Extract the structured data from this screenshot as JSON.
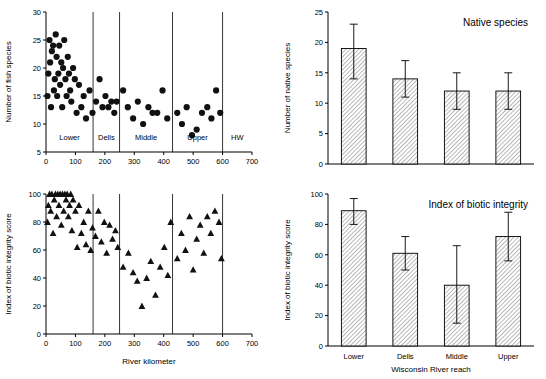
{
  "chart_data": [
    {
      "id": "scatter-species",
      "type": "scatter",
      "title": "",
      "xlabel": "",
      "ylabel": "Number of fish species",
      "xlim": [
        0,
        700
      ],
      "xticks": [
        0,
        100,
        200,
        300,
        400,
        500,
        600,
        700
      ],
      "ylim": [
        5,
        30
      ],
      "yticks": [
        5,
        10,
        15,
        20,
        25,
        30
      ],
      "grid": false,
      "reach_dividers": [
        160,
        250,
        430,
        600
      ],
      "reach_labels": [
        {
          "label": "Lower",
          "x": 80
        },
        {
          "label": "Dells",
          "x": 205
        },
        {
          "label": "Middle",
          "x": 340
        },
        {
          "label": "Upper",
          "x": 515
        },
        {
          "label": "HW",
          "x": 650
        }
      ],
      "marker": "circle",
      "points": [
        [
          5,
          15
        ],
        [
          8,
          19
        ],
        [
          12,
          25
        ],
        [
          14,
          21
        ],
        [
          17,
          13
        ],
        [
          20,
          23
        ],
        [
          24,
          24
        ],
        [
          27,
          16
        ],
        [
          30,
          18
        ],
        [
          33,
          26
        ],
        [
          36,
          22
        ],
        [
          38,
          15
        ],
        [
          42,
          19
        ],
        [
          45,
          24
        ],
        [
          48,
          17
        ],
        [
          52,
          21
        ],
        [
          55,
          13
        ],
        [
          58,
          20
        ],
        [
          62,
          25
        ],
        [
          66,
          18
        ],
        [
          70,
          15
        ],
        [
          74,
          22
        ],
        [
          78,
          19
        ],
        [
          82,
          16
        ],
        [
          86,
          14
        ],
        [
          92,
          20
        ],
        [
          98,
          18
        ],
        [
          104,
          12
        ],
        [
          112,
          17
        ],
        [
          120,
          13
        ],
        [
          128,
          15
        ],
        [
          136,
          11
        ],
        [
          148,
          16
        ],
        [
          158,
          12
        ],
        [
          170,
          14
        ],
        [
          182,
          18
        ],
        [
          192,
          13
        ],
        [
          202,
          15
        ],
        [
          212,
          13
        ],
        [
          222,
          14
        ],
        [
          232,
          12
        ],
        [
          240,
          14
        ],
        [
          262,
          16
        ],
        [
          278,
          13
        ],
        [
          296,
          11
        ],
        [
          312,
          14
        ],
        [
          330,
          10
        ],
        [
          348,
          13
        ],
        [
          362,
          12
        ],
        [
          378,
          12
        ],
        [
          396,
          16
        ],
        [
          412,
          11
        ],
        [
          446,
          12
        ],
        [
          462,
          10
        ],
        [
          478,
          13
        ],
        [
          496,
          8
        ],
        [
          512,
          9
        ],
        [
          530,
          12
        ],
        [
          548,
          13
        ],
        [
          562,
          11
        ],
        [
          578,
          16
        ],
        [
          592,
          12
        ]
      ]
    },
    {
      "id": "bar-native-species",
      "type": "bar",
      "title": "Native species",
      "xlabel": "",
      "ylabel": "Number of native species",
      "categories": [
        "Lower",
        "Dells",
        "Middle",
        "Upper"
      ],
      "values": [
        19,
        14,
        12,
        12
      ],
      "errors_upper": [
        23,
        17,
        15,
        15
      ],
      "errors_lower": [
        14,
        11,
        9,
        9
      ],
      "ylim": [
        0,
        25
      ],
      "yticks": [
        0,
        5,
        10,
        15,
        20,
        25
      ],
      "grid": false
    },
    {
      "id": "scatter-ibi",
      "type": "scatter",
      "title": "",
      "xlabel": "River kilometer",
      "ylabel": "Index of biotic integrity score",
      "xlim": [
        0,
        700
      ],
      "xticks": [
        0,
        100,
        200,
        300,
        400,
        500,
        600,
        700
      ],
      "ylim": [
        0,
        100
      ],
      "yticks": [
        0,
        20,
        40,
        60,
        80,
        100
      ],
      "grid": false,
      "reach_dividers": [
        160,
        250,
        430,
        600
      ],
      "marker": "triangle",
      "points": [
        [
          5,
          80
        ],
        [
          8,
          92
        ],
        [
          12,
          100
        ],
        [
          16,
          88
        ],
        [
          20,
          100
        ],
        [
          24,
          72
        ],
        [
          28,
          96
        ],
        [
          32,
          100
        ],
        [
          36,
          84
        ],
        [
          40,
          100
        ],
        [
          44,
          92
        ],
        [
          48,
          100
        ],
        [
          52,
          78
        ],
        [
          56,
          100
        ],
        [
          60,
          88
        ],
        [
          64,
          100
        ],
        [
          68,
          96
        ],
        [
          72,
          100
        ],
        [
          76,
          84
        ],
        [
          80,
          92
        ],
        [
          84,
          100
        ],
        [
          88,
          74
        ],
        [
          92,
          96
        ],
        [
          100,
          88
        ],
        [
          106,
          62
        ],
        [
          112,
          92
        ],
        [
          120,
          72
        ],
        [
          128,
          80
        ],
        [
          136,
          64
        ],
        [
          144,
          88
        ],
        [
          152,
          60
        ],
        [
          158,
          76
        ],
        [
          168,
          70
        ],
        [
          178,
          88
        ],
        [
          188,
          66
        ],
        [
          198,
          80
        ],
        [
          206,
          58
        ],
        [
          216,
          78
        ],
        [
          226,
          68
        ],
        [
          236,
          74
        ],
        [
          244,
          62
        ],
        [
          262,
          48
        ],
        [
          280,
          58
        ],
        [
          296,
          44
        ],
        [
          310,
          38
        ],
        [
          326,
          20
        ],
        [
          342,
          40
        ],
        [
          356,
          52
        ],
        [
          372,
          28
        ],
        [
          388,
          48
        ],
        [
          402,
          62
        ],
        [
          414,
          42
        ],
        [
          424,
          80
        ],
        [
          446,
          54
        ],
        [
          460,
          72
        ],
        [
          474,
          60
        ],
        [
          488,
          84
        ],
        [
          500,
          46
        ],
        [
          512,
          68
        ],
        [
          524,
          78
        ],
        [
          536,
          58
        ],
        [
          548,
          84
        ],
        [
          560,
          72
        ],
        [
          574,
          88
        ],
        [
          588,
          80
        ],
        [
          596,
          54
        ]
      ]
    },
    {
      "id": "bar-ibi",
      "type": "bar",
      "title": "Index of biotic integrity",
      "xlabel": "Wisconsin River reach",
      "ylabel": "Index of biotic integrity score",
      "categories": [
        "Lower",
        "Dells",
        "Middle",
        "Upper"
      ],
      "values": [
        89,
        61,
        40,
        72
      ],
      "errors_upper": [
        97,
        72,
        66,
        88
      ],
      "errors_lower": [
        80,
        50,
        15,
        56
      ],
      "ylim": [
        0,
        100
      ],
      "yticks": [
        0,
        20,
        40,
        60,
        80,
        100
      ],
      "grid": false
    }
  ],
  "labels": {
    "scatter_species_y": "Number of fish species",
    "scatter_ibi_y": "Index of biotic integrity score",
    "scatter_ibi_x": "River kilometer",
    "bar_native_y": "Number of native species",
    "bar_native_title": "Native species",
    "bar_ibi_y": "Index of biotic integrity score",
    "bar_ibi_title": "Index of biotic integrity",
    "bar_ibi_x": "Wisconsin River reach",
    "reach_lower": "Lower",
    "reach_dells": "Dells",
    "reach_middle": "Middle",
    "reach_upper": "Upper",
    "reach_hw": "HW"
  }
}
